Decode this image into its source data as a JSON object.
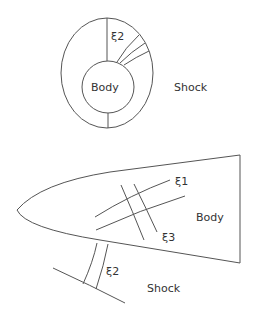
{
  "top_figure": {
    "body_label": "Body",
    "shock_label": "Shock",
    "coord_label": "ξ2"
  },
  "bottom_figure": {
    "body_label": "Body",
    "shock_label": "Shock",
    "coord_labels": [
      "ξ1",
      "ξ3",
      "ξ2"
    ]
  },
  "colors": {
    "stroke": "#555555",
    "text": "#333333"
  }
}
